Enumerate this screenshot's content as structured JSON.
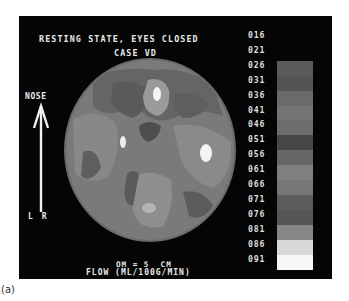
{
  "figure": {
    "title_line1": "RESTING STATE, EYES CLOSED",
    "title_line2": "CASE VD",
    "orientation_label": "NOSE",
    "orientation_arrow_icon": "up-arrow-icon",
    "left_right_label": "L R",
    "scale_bar_label": "OM = 5  CM",
    "units_label": "FLOW (ML/100G/MIN)",
    "caption": "(a)"
  },
  "color_scale": {
    "labels": [
      "016",
      "021",
      "026",
      "031",
      "036",
      "041",
      "046",
      "051",
      "056",
      "061",
      "066",
      "071",
      "076",
      "081",
      "086",
      "091"
    ],
    "segments": [
      {
        "value": "026",
        "color": "#5a5a5a"
      },
      {
        "value": "031",
        "color": "#545454"
      },
      {
        "value": "036",
        "color": "#6a6a6a"
      },
      {
        "value": "041",
        "color": "#737373"
      },
      {
        "value": "046",
        "color": "#6c6c6c"
      },
      {
        "value": "051",
        "color": "#464646"
      },
      {
        "value": "056",
        "color": "#666666"
      },
      {
        "value": "061",
        "color": "#7f7f7f"
      },
      {
        "value": "066",
        "color": "#777777"
      },
      {
        "value": "071",
        "color": "#5c5c5c"
      },
      {
        "value": "076",
        "color": "#555555"
      },
      {
        "value": "081",
        "color": "#868686"
      },
      {
        "value": "086",
        "color": "#d8d8d8"
      },
      {
        "value": "091",
        "color": "#f7f7f7"
      }
    ]
  },
  "colors": {
    "background": "#050505",
    "text": "#e8e8e8"
  }
}
